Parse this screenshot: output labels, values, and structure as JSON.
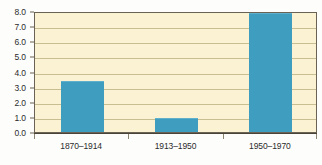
{
  "chart_data": {
    "type": "bar",
    "title": "",
    "subtitle": "",
    "xlabel": "",
    "ylabel": "",
    "categories": [
      "1870–1914",
      "1913–1950",
      "1950–1970"
    ],
    "values": [
      3.4,
      0.9,
      7.9
    ],
    "ylim": [
      0.0,
      8.0
    ],
    "ytick_labels": [
      "0.0",
      "1.0",
      "2.0",
      "3.0",
      "4.0",
      "5.0",
      "6.0",
      "7.0",
      "8.0"
    ],
    "ytick_values": [
      0.0,
      1.0,
      2.0,
      3.0,
      4.0,
      5.0,
      6.0,
      7.0,
      8.0
    ],
    "grid": true,
    "legend": null,
    "legend_position": "none",
    "annotations": [],
    "colors": {
      "bar": "#3f9dc0",
      "bar_highlight": "#5fb0cd",
      "plot_background": "#fbf2d4",
      "gridline": "#c9bd92",
      "frame": "#6a6355",
      "axis": "#4a4438",
      "tick_label": "#2b2b2b",
      "page_background": "#fdfdfb"
    }
  }
}
